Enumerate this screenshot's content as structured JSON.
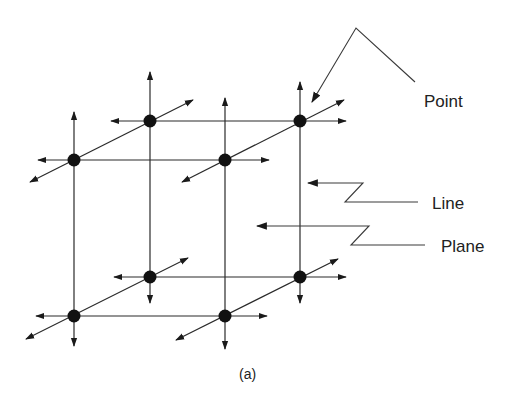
{
  "figure": {
    "caption": "(a)",
    "labels": {
      "point": "Point",
      "line": "Line",
      "plane": "Plane"
    },
    "colors": {
      "ink": "#1a1a1a",
      "background": "#ffffff"
    },
    "nodes": [
      {
        "id": "top-back-left",
        "x": 150,
        "y": 121
      },
      {
        "id": "top-back-right",
        "x": 300,
        "y": 121
      },
      {
        "id": "top-front-left",
        "x": 74,
        "y": 160
      },
      {
        "id": "top-front-right",
        "x": 225,
        "y": 160
      },
      {
        "id": "bottom-back-left",
        "x": 150,
        "y": 277
      },
      {
        "id": "bottom-back-right",
        "x": 300,
        "y": 277
      },
      {
        "id": "bottom-front-left",
        "x": 74,
        "y": 316
      },
      {
        "id": "bottom-front-right",
        "x": 225,
        "y": 316
      }
    ]
  }
}
